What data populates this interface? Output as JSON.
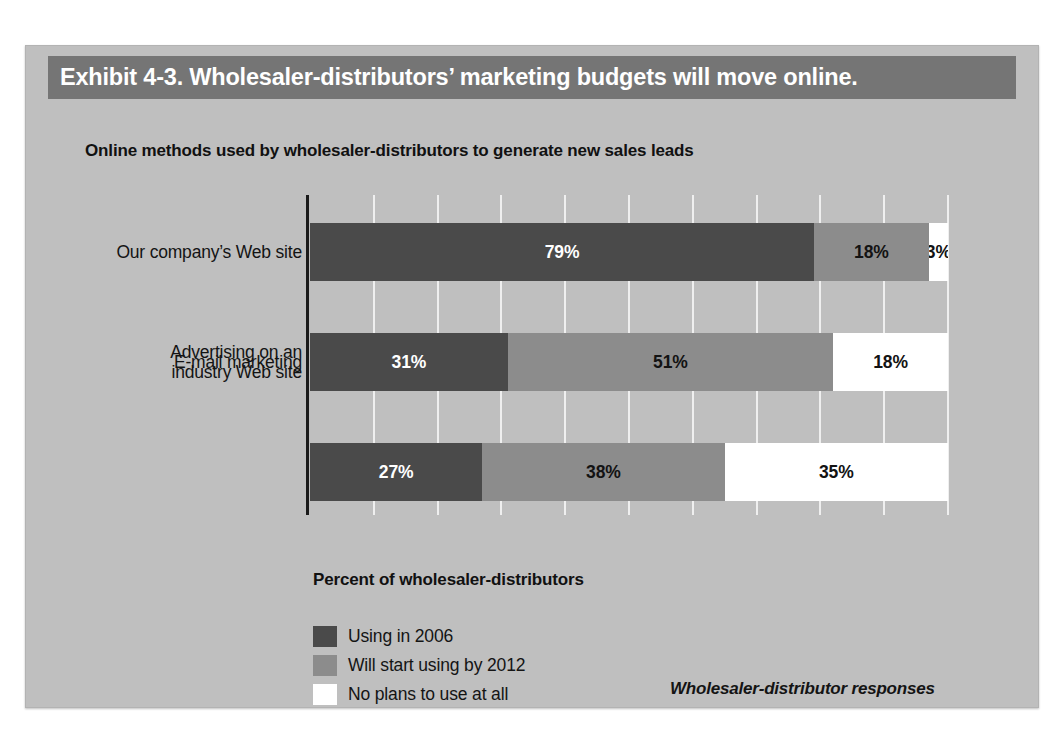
{
  "exhibit": {
    "title": "Exhibit 4-3. Wholesaler-distributors’ marketing budgets will move online.",
    "subtitle": "Online methods used by wholesaler-distributors to generate new sales leads",
    "source_note": "Wholesaler-distributor responses"
  },
  "colors": {
    "panel_background": "#bfbfbf",
    "title_bar": "#757575",
    "series_0": "#4a4a4a",
    "series_1": "#8c8c8c",
    "series_2": "#ffffff",
    "axis": "#1a1a1a",
    "gridline": "#efefef"
  },
  "chart_data": {
    "type": "bar",
    "orientation": "horizontal",
    "stacked": true,
    "stack_mode": "percent",
    "title": "Online methods used by wholesaler-distributors to generate new sales leads",
    "xlabel": "Percent of wholesaler-distributors",
    "ylabel": "",
    "xlim": [
      0,
      100
    ],
    "xticks": [
      0,
      10,
      20,
      30,
      40,
      50,
      60,
      70,
      80,
      90,
      100
    ],
    "xtick_labels": [],
    "grid": true,
    "legend_position": "bottom-left",
    "categories": [
      "Our company’s Web site",
      "E-mail marketing",
      "Advertising on an industry Web site"
    ],
    "category_display": [
      [
        "Our company’s Web site"
      ],
      [
        "E-mail marketing"
      ],
      [
        "Advertising on an",
        "industry Web site"
      ]
    ],
    "series": [
      {
        "name": "Using in 2006",
        "values": [
          79,
          31,
          27
        ],
        "labels": [
          "79%",
          "31%",
          "27%"
        ],
        "color": "#4a4a4a"
      },
      {
        "name": "Will start using by 2012",
        "values": [
          18,
          51,
          38
        ],
        "labels": [
          "18%",
          "51%",
          "38%"
        ],
        "color": "#8c8c8c"
      },
      {
        "name": "No plans to use at all",
        "values": [
          3,
          18,
          35
        ],
        "labels": [
          "3%",
          "18%",
          "35%"
        ],
        "color": "#ffffff"
      }
    ],
    "annotations": [
      "Wholesaler-distributor responses"
    ]
  }
}
